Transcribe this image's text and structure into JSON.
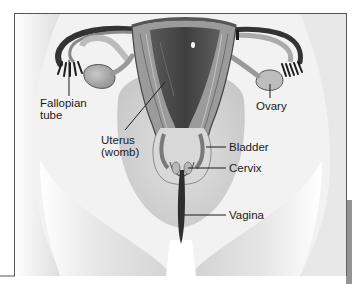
{
  "diagram": {
    "type": "anatomical-illustration",
    "colors": {
      "skin_light": "#f4f4f4",
      "skin_shade": "#cfcfcf",
      "tissue_mid": "#9a9a9a",
      "tissue_dark": "#4a4a4a",
      "cavity_dark": "#3a3a3a",
      "frame": "#555555",
      "label_text": "#1a1a1a"
    },
    "labels": {
      "fallopian_tube_line1": "Fallopian",
      "fallopian_tube_line2": "tube",
      "ovary": "Ovary",
      "uterus_line1": "Uterus",
      "uterus_line2": "(womb)",
      "bladder": "Bladder",
      "cervix": "Cervix",
      "vagina": "Vagina"
    }
  }
}
